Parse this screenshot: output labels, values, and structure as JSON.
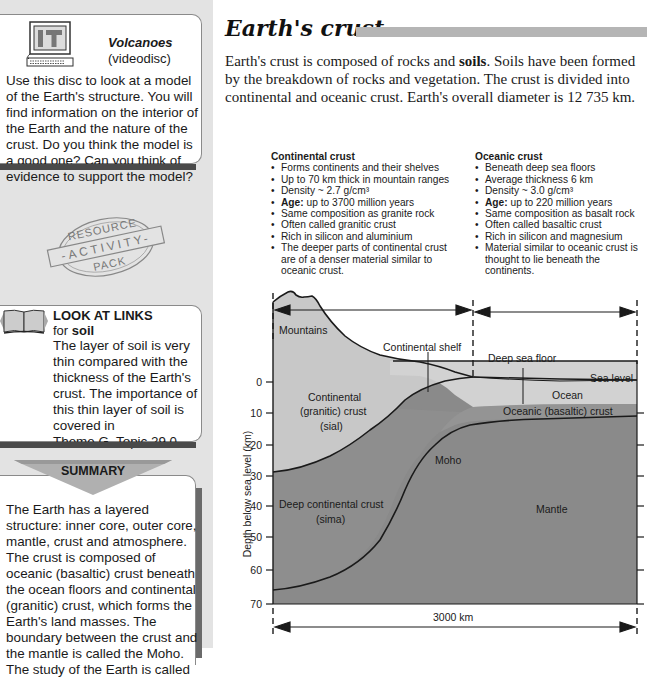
{
  "sidebar": {
    "it_box": {
      "icon": "computer-it-icon",
      "icon_text": "IT",
      "title": "Volcanoes",
      "subtitle": "(videodisc)",
      "body": "Use this disc to look at a model of the Earth's structure. You will find information on the interior of the Earth and the nature of the crust. Do you think the model is a good one? Can you think of evidence to support the model?"
    },
    "stamp": {
      "icon": "resource-activity-pack-stamp",
      "top": "RESOURCE",
      "middle": "-ACTIVITY-",
      "bottom": "PACK"
    },
    "links_box": {
      "icon": "book-icon",
      "title": "LOOK AT LINKS",
      "for_prefix": "for ",
      "for_term": "soil",
      "body": "The layer of soil is very thin compared with the thickness of the Earth's crust. The importance of this thin layer of soil is covered in",
      "reference": "Theme G, Topic 29.0."
    },
    "summary": {
      "label": "SUMMARY",
      "body": "The Earth has a layered structure: inner core, outer core, mantle, crust and atmosphere. The crust is composed of oceanic (basaltic) crust beneath the ocean floors and continental (granitic) crust, which forms the Earth's land masses. The boundary between the crust and the mantle is called the Moho. The study of the Earth is called"
    }
  },
  "main": {
    "title": "Earth's crust",
    "intro_part1": "Earth's crust is composed of rocks and ",
    "intro_bold": "soils",
    "intro_part2": ". Soils have been formed by the breakdown of rocks and vegetation. The crust is divided into continental and oceanic crust. Earth's overall diameter is 12 735 km.",
    "continental": {
      "heading": "Continental crust",
      "items": [
        {
          "text": "Forms continents and their shelves"
        },
        {
          "text": "Up to 70 km thick in mountain ranges"
        },
        {
          "text": "Density ~ 2.7 g/cm³"
        },
        {
          "bold": "Age:",
          "text": " up to 3700 million years"
        },
        {
          "text": "Same composition as granite rock"
        },
        {
          "text": "Often called granitic crust"
        },
        {
          "text": "Rich in silicon and aluminium"
        },
        {
          "text": "The deeper parts of continental crust are of a denser material similar to oceanic crust."
        }
      ]
    },
    "oceanic": {
      "heading": "Oceanic crust",
      "items": [
        {
          "text": "Beneath deep sea floors"
        },
        {
          "text": "Average thickness 6 km"
        },
        {
          "text": "Density ~ 3.0 g/cm³"
        },
        {
          "bold": "Age:",
          "text": " up to 220 million years"
        },
        {
          "text": "Same composition as basalt rock"
        },
        {
          "text": "Often called basaltic crust"
        },
        {
          "text": "Rich in silicon and magnesium"
        },
        {
          "text": "Material similar to oceanic crust is thought to lie beneath the continents."
        }
      ]
    },
    "diagram": {
      "y_axis_label": "Depth below sea level (km)",
      "y_ticks": [
        "0",
        "10",
        "20",
        "30",
        "40",
        "50",
        "60",
        "70"
      ],
      "labels": {
        "mountains": "Mountains",
        "continental_shelf": "Continental shelf",
        "deep_sea_floor": "Deep sea floor",
        "sea_level": "Sea level",
        "ocean": "Ocean",
        "continental_crust_1": "Continental",
        "continental_crust_2": "(granitic) crust",
        "continental_crust_3": "(sial)",
        "oceanic_crust": "Oceanic (basaltic) crust",
        "moho": "Moho",
        "deep_continental_1": "Deep continental crust",
        "deep_continental_2": "(sima)",
        "mantle": "Mantle",
        "scale": "3000 km"
      },
      "colors": {
        "sial": "#c8c8c8",
        "ocean": "#d2d2d2",
        "sima": "#8e8e8e",
        "mantle": "#8a8a8a",
        "sidebar_bg": "#e3e3e3",
        "title_bar": "#b5b5b5"
      }
    }
  }
}
